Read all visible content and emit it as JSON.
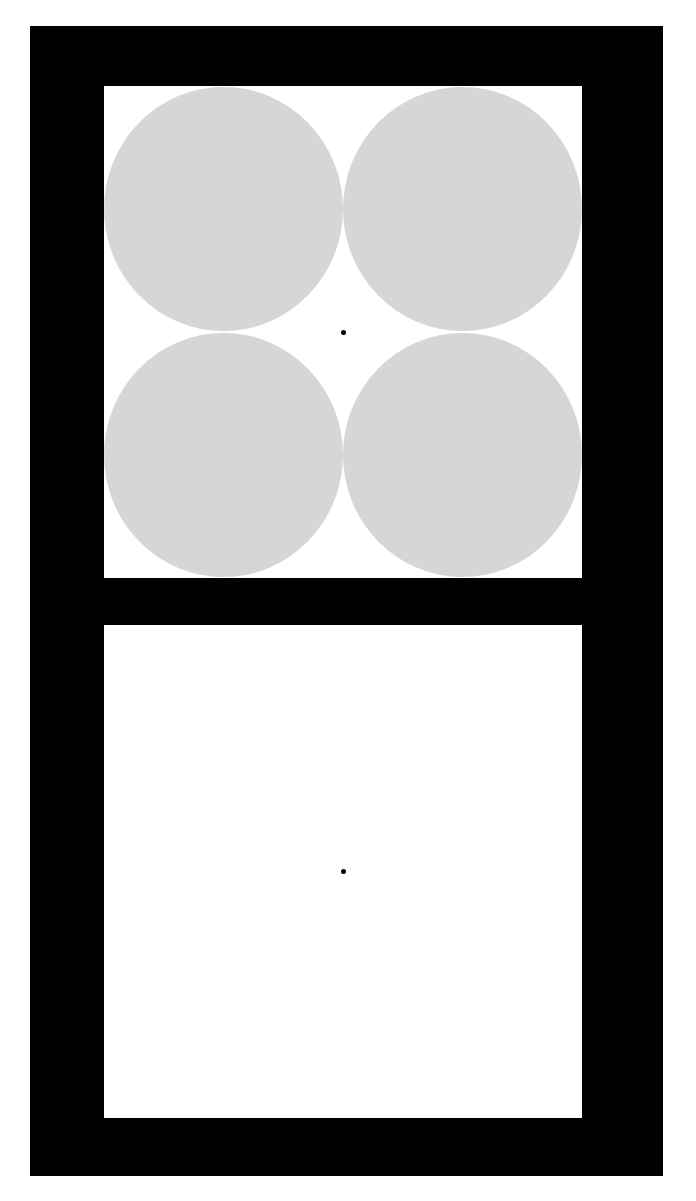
{
  "colors": {
    "frame": "#000000",
    "panel": "#ffffff",
    "circle": "#d6d6d6",
    "dot": "#000000"
  },
  "top_panel": {
    "circles": [
      {
        "position": "top-left"
      },
      {
        "position": "top-right"
      },
      {
        "position": "bottom-left"
      },
      {
        "position": "bottom-right"
      }
    ],
    "center_dot": true
  },
  "bottom_panel": {
    "circles": [],
    "center_dot": true
  }
}
